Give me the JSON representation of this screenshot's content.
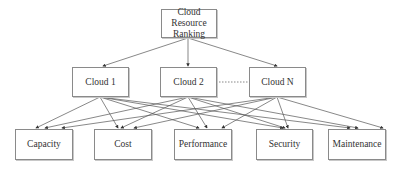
{
  "diagram": {
    "root": {
      "label": "Cloud Resource Ranking",
      "line1": "Cloud Resource",
      "line2": "Ranking"
    },
    "clouds": [
      {
        "label": "Cloud 1"
      },
      {
        "label": "Cloud 2"
      },
      {
        "label": "Cloud N"
      }
    ],
    "criteria": [
      {
        "label": "Capacity"
      },
      {
        "label": "Cost"
      },
      {
        "label": "Performance"
      },
      {
        "label": "Security"
      },
      {
        "label": "Maintenance"
      }
    ],
    "edges": {
      "root_to_clouds": "arrow",
      "cloud2_to_cloudN": "dotted",
      "clouds_to_criteria": "arrow, every cloud to every criterion"
    }
  }
}
